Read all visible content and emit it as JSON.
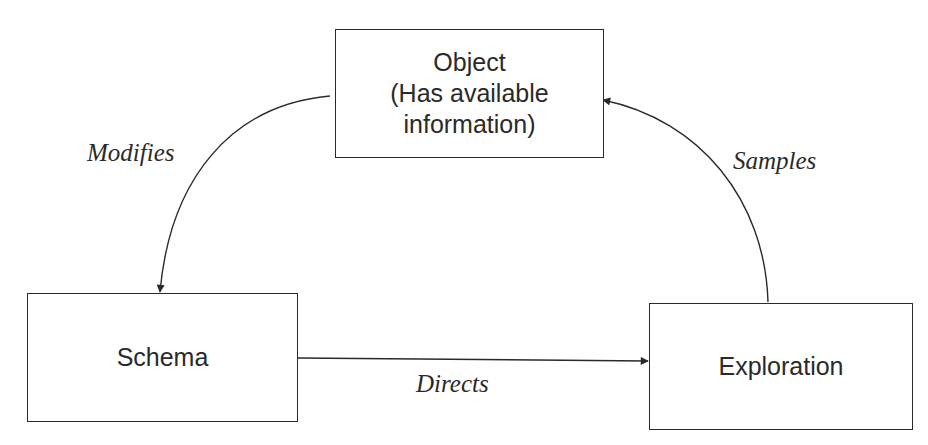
{
  "diagram": {
    "nodes": {
      "object": {
        "lines": [
          "Object",
          "(Has available",
          "information)"
        ]
      },
      "schema": {
        "label": "Schema"
      },
      "exploration": {
        "label": "Exploration"
      }
    },
    "edges": {
      "modifies": {
        "from": "object",
        "to": "schema",
        "label": "Modifies"
      },
      "directs": {
        "from": "schema",
        "to": "exploration",
        "label": "Directs"
      },
      "samples": {
        "from": "exploration",
        "to": "object",
        "label": "Samples"
      }
    },
    "colors": {
      "stroke": "#2a2a2a",
      "background": "#ffffff"
    }
  }
}
